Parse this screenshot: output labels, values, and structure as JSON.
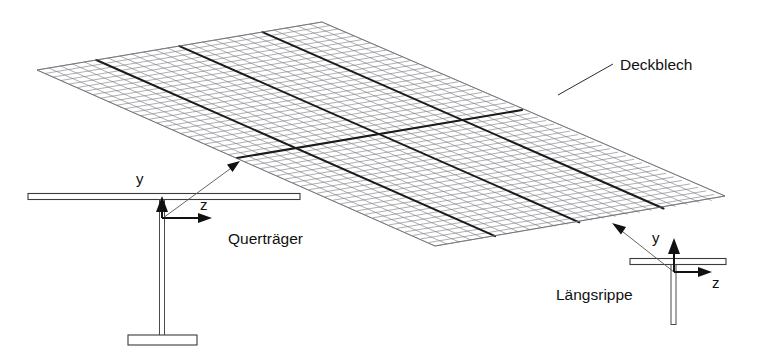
{
  "figure": {
    "kind": "engineering-diagram",
    "background_color": "#ffffff",
    "line_color": "#1b1b1b",
    "mesh_color": "#7d7d84"
  },
  "labels": {
    "deck_plate": "Deckblech",
    "cross_girder": "Querträger",
    "longitudinal_rib": "Längsrippe"
  },
  "axes": {
    "cross_girder": {
      "vertical": "y",
      "horizontal": "z"
    },
    "longitudinal_rib": {
      "vertical": "y",
      "horizontal": "z"
    }
  }
}
